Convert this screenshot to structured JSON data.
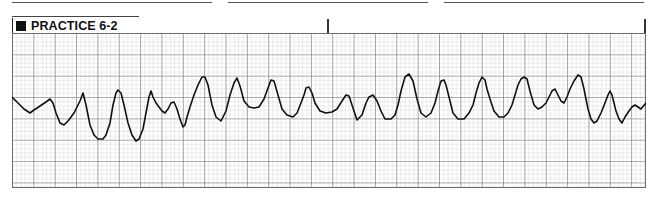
{
  "header": {
    "title": "PRACTICE 6-2",
    "title_icon": "filled-square-icon"
  },
  "ecg_strip": {
    "grid": {
      "small_box_px": 4.27,
      "major_box_px": 21.35,
      "minor_color": "#b8b8b8",
      "major_color": "#6a6a6a",
      "background": "#ffffff"
    },
    "trace_color": "#111111",
    "rhythm_appearance": "irregular polymorphic wide-complex waveform with varying amplitude",
    "complex_count": 22
  },
  "colors": {
    "ink": "#111111",
    "rule": "#555555"
  }
}
